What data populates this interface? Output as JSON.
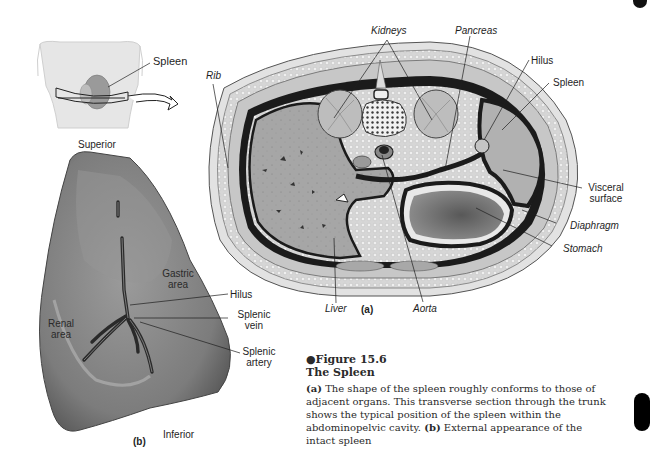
{
  "figure": {
    "number": "●Figure 15.6",
    "title": "The Spleen",
    "caption": {
      "part_a_label": "(a)",
      "part_a_text": " The shape of the spleen roughly conforms to those of adjacent organs. This transverse section through the trunk shows the typical position of the spleen within the abdominopelvic cavity. ",
      "part_b_label": "(b)",
      "part_b_text": " External appearance of the intact spleen"
    }
  },
  "inset": {
    "spleen_label": "Spleen",
    "orientation_top": "Superior"
  },
  "panel_a": {
    "panel_label": "(a)",
    "labels": {
      "kidneys": "Kidneys",
      "pancreas": "Pancreas",
      "hilus": "Hilus",
      "spleen": "Spleen",
      "rib": "Rib",
      "visceral_surface_line1": "Visceral",
      "visceral_surface_line2": "surface",
      "diaphragm": "Diaphragm",
      "stomach": "Stomach",
      "liver": "Liver",
      "aorta": "Aorta"
    }
  },
  "panel_b": {
    "panel_label": "(b)",
    "labels": {
      "gastric_area_line1": "Gastric",
      "gastric_area_line2": "area",
      "hilus": "Hilus",
      "renal_area_line1": "Renal",
      "renal_area_line2": "area",
      "splenic_vein_line1": "Splenic",
      "splenic_vein_line2": "vein",
      "splenic_artery_line1": "Splenic",
      "splenic_artery_line2": "artery",
      "orientation_bottom": "Inferior"
    }
  },
  "colors": {
    "organ_gray": "#9a9a9a",
    "tissue_light": "#d8d8d8",
    "outline_dark": "#1a1a1a",
    "spleen_gray": "#8a8a8a"
  }
}
